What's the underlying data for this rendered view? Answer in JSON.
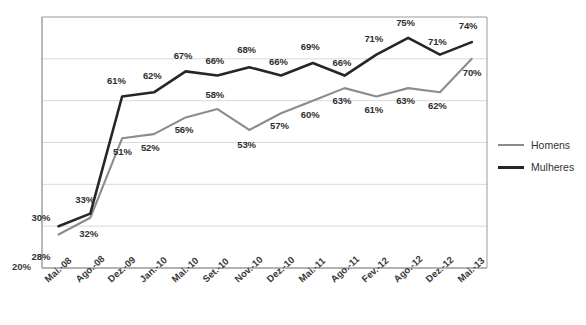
{
  "chart_data": {
    "type": "line",
    "title": "",
    "subtitle": "",
    "xlabel": "",
    "ylabel": "",
    "grid": true,
    "legend_position": "right",
    "ylim": [
      20,
      80
    ],
    "y_tick_labels": [
      "20%"
    ],
    "y_gridline_values": [
      30,
      40,
      50,
      60,
      70,
      80
    ],
    "categories": [
      "Mai.-08",
      "Ago.-08",
      "Dez.-09",
      "Jan.-10",
      "Mai.-10",
      "Set.-10",
      "Nov.-10",
      "Dez.-10",
      "Mai.-11",
      "Ago.-11",
      "Fev.-12",
      "Ago.-12",
      "Dez.-12",
      "Mai.-13"
    ],
    "series": [
      {
        "name": "Homens",
        "color": "#8c8c8c",
        "values": [
          28,
          32,
          51,
          52,
          56,
          58,
          53,
          57,
          60,
          63,
          61,
          63,
          62,
          70
        ],
        "labels": [
          "28%",
          "32%",
          "51%",
          "52%",
          "56%",
          "58%",
          "53%",
          "57%",
          "60%",
          "63%",
          "61%",
          "63%",
          "62%",
          "70%"
        ]
      },
      {
        "name": "Mulheres",
        "color": "#262626",
        "values": [
          30,
          33,
          61,
          62,
          67,
          66,
          68,
          66,
          69,
          66,
          71,
          75,
          71,
          74
        ],
        "labels": [
          "30%",
          "33%",
          "61%",
          "62%",
          "67%",
          "66%",
          "68%",
          "66%",
          "69%",
          "66%",
          "71%",
          "75%",
          "71%",
          "74%"
        ]
      }
    ]
  },
  "axis": {
    "y_origin_label": "20%"
  },
  "legend": {
    "items": [
      {
        "label": "Homens",
        "color": "#8c8c8c"
      },
      {
        "label": "Mulheres",
        "color": "#262626"
      }
    ]
  },
  "colors": {
    "homens": "#8c8c8c",
    "mulheres": "#262626",
    "grid": "#d9d9d9",
    "frame": "#9a9a9a",
    "background": "#ffffff"
  }
}
